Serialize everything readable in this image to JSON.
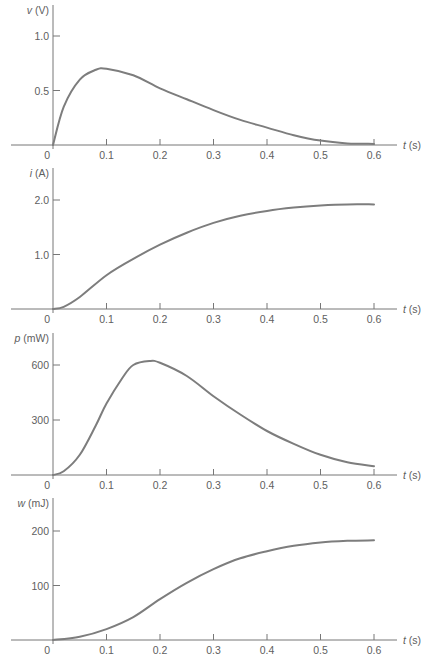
{
  "chart_data": [
    {
      "type": "line",
      "title": "",
      "ylabel": "v (V)",
      "ylabel_symbol": "v",
      "ylabel_unit": "(V)",
      "xlabel": "t (s)",
      "xlabel_symbol": "t",
      "xlabel_unit": "(s)",
      "xlim": [
        0,
        0.6
      ],
      "ylim": [
        0,
        1.2
      ],
      "x_ticks": [
        "0",
        "0.1",
        "0.2",
        "0.3",
        "0.4",
        "0.5",
        "0.6"
      ],
      "y_ticks": [
        {
          "value": 0.5,
          "label": "0.5"
        },
        {
          "value": 1.0,
          "label": "1.0"
        }
      ],
      "grid": false,
      "x": [
        0,
        0.02,
        0.05,
        0.08,
        0.1,
        0.15,
        0.2,
        0.25,
        0.3,
        0.35,
        0.4,
        0.45,
        0.5,
        0.55,
        0.6
      ],
      "values": [
        0,
        0.35,
        0.6,
        0.69,
        0.7,
        0.64,
        0.52,
        0.42,
        0.32,
        0.23,
        0.16,
        0.09,
        0.04,
        0.015,
        0.01
      ]
    },
    {
      "type": "line",
      "title": "",
      "ylabel": "i (A)",
      "ylabel_symbol": "i",
      "ylabel_unit": "(A)",
      "xlabel": "t (s)",
      "xlabel_symbol": "t",
      "xlabel_unit": "(s)",
      "xlim": [
        0,
        0.6
      ],
      "ylim": [
        0,
        2.4
      ],
      "x_ticks": [
        "0",
        "0.1",
        "0.2",
        "0.3",
        "0.4",
        "0.5",
        "0.6"
      ],
      "y_ticks": [
        {
          "value": 1.0,
          "label": "1.0"
        },
        {
          "value": 2.0,
          "label": "2.0"
        }
      ],
      "grid": false,
      "x": [
        0,
        0.02,
        0.05,
        0.1,
        0.15,
        0.2,
        0.25,
        0.3,
        0.35,
        0.4,
        0.45,
        0.5,
        0.55,
        0.6
      ],
      "values": [
        0,
        0.04,
        0.22,
        0.62,
        0.92,
        1.18,
        1.4,
        1.58,
        1.71,
        1.8,
        1.86,
        1.9,
        1.92,
        1.92
      ]
    },
    {
      "type": "line",
      "title": "",
      "ylabel": "p (mW)",
      "ylabel_symbol": "p",
      "ylabel_unit": "(mW)",
      "xlabel": "t (s)",
      "xlabel_symbol": "t",
      "xlabel_unit": "(s)",
      "xlim": [
        0,
        0.6
      ],
      "ylim": [
        0,
        720
      ],
      "x_ticks": [
        "0",
        "0.1",
        "0.2",
        "0.3",
        "0.4",
        "0.5",
        "0.6"
      ],
      "y_ticks": [
        {
          "value": 300,
          "label": "300"
        },
        {
          "value": 600,
          "label": "600"
        }
      ],
      "grid": false,
      "x": [
        0,
        0.02,
        0.05,
        0.08,
        0.1,
        0.13,
        0.15,
        0.18,
        0.2,
        0.25,
        0.3,
        0.35,
        0.4,
        0.45,
        0.5,
        0.55,
        0.6
      ],
      "values": [
        0,
        20,
        110,
        270,
        390,
        530,
        600,
        622,
        612,
        540,
        430,
        330,
        240,
        170,
        110,
        70,
        48
      ]
    },
    {
      "type": "line",
      "title": "",
      "ylabel": "w (mJ)",
      "ylabel_symbol": "w",
      "ylabel_unit": "(mJ)",
      "xlabel": "t (s)",
      "xlabel_symbol": "t",
      "xlabel_unit": "(s)",
      "xlim": [
        0,
        0.6
      ],
      "ylim": [
        0,
        240
      ],
      "x_ticks": [
        "0",
        "0.1",
        "0.2",
        "0.3",
        "0.4",
        "0.5",
        "0.6"
      ],
      "y_ticks": [
        {
          "value": 100,
          "label": "100"
        },
        {
          "value": 200,
          "label": "200"
        }
      ],
      "grid": false,
      "x": [
        0,
        0.05,
        0.1,
        0.15,
        0.2,
        0.25,
        0.3,
        0.35,
        0.4,
        0.45,
        0.5,
        0.55,
        0.6
      ],
      "values": [
        0,
        6,
        20,
        42,
        75,
        105,
        130,
        150,
        163,
        173,
        179,
        182,
        183
      ]
    }
  ]
}
